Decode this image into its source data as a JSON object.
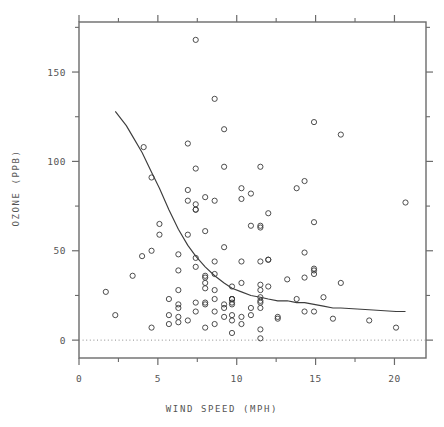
{
  "chart_data": {
    "type": "scatter",
    "title": "",
    "xlabel": "WIND SPEED (MPH)",
    "ylabel": "OZONE (PPB)",
    "xlim": [
      0,
      22
    ],
    "ylim": [
      -10,
      178
    ],
    "grid": false,
    "legend": "none",
    "x_ticks_major": [
      0,
      5,
      10,
      15,
      20
    ],
    "x_tick_labels": [
      "0",
      "5",
      "10",
      "15",
      "20"
    ],
    "x_ticks_minor": [
      2.5,
      7.5,
      12.5,
      17.5
    ],
    "y_ticks_major": [
      0,
      50,
      100,
      150
    ],
    "y_tick_labels": [
      "0",
      "50",
      "100",
      "150"
    ],
    "y_ticks_minor": [
      25,
      75,
      125,
      175
    ],
    "reference_line": {
      "orientation": "horizontal",
      "value": 0,
      "style": "dotted"
    },
    "marker": {
      "shape": "open-circle",
      "radius": 2.6,
      "color": "#3a3a3a"
    },
    "series": [
      {
        "name": "Ozone vs Wind",
        "points": [
          [
            7.4,
            41
          ],
          [
            8.0,
            36
          ],
          [
            12.6,
            12
          ],
          [
            11.5,
            18
          ],
          [
            8.6,
            28
          ],
          [
            13.8,
            23
          ],
          [
            20.1,
            7
          ],
          [
            8.6,
            16
          ],
          [
            6.9,
            11
          ],
          [
            9.7,
            14
          ],
          [
            9.2,
            18
          ],
          [
            10.9,
            14
          ],
          [
            13.2,
            34
          ],
          [
            11.5,
            6
          ],
          [
            12.0,
            30
          ],
          [
            18.4,
            11
          ],
          [
            11.5,
            1
          ],
          [
            9.7,
            11
          ],
          [
            9.7,
            4
          ],
          [
            16.6,
            32
          ],
          [
            9.7,
            23
          ],
          [
            12.0,
            45
          ],
          [
            16.6,
            115
          ],
          [
            14.9,
            37
          ],
          [
            8.0,
            29
          ],
          [
            12.0,
            71
          ],
          [
            14.9,
            39
          ],
          [
            5.7,
            23
          ],
          [
            7.4,
            21
          ],
          [
            8.6,
            37
          ],
          [
            9.7,
            20
          ],
          [
            16.1,
            12
          ],
          [
            9.2,
            13
          ],
          [
            8.6,
            135
          ],
          [
            14.3,
            49
          ],
          [
            8.0,
            32
          ],
          [
            11.5,
            64
          ],
          [
            14.9,
            40
          ],
          [
            20.7,
            77
          ],
          [
            9.2,
            97
          ],
          [
            11.5,
            97
          ],
          [
            10.3,
            85
          ],
          [
            6.3,
            10
          ],
          [
            1.7,
            27
          ],
          [
            4.6,
            7
          ],
          [
            6.3,
            48
          ],
          [
            8.0,
            35
          ],
          [
            8.0,
            61
          ],
          [
            10.3,
            79
          ],
          [
            11.5,
            63
          ],
          [
            14.9,
            16
          ],
          [
            8.0,
            80
          ],
          [
            4.1,
            108
          ],
          [
            9.2,
            20
          ],
          [
            9.2,
            52
          ],
          [
            10.9,
            82
          ],
          [
            4.6,
            50
          ],
          [
            10.9,
            64
          ],
          [
            5.1,
            59
          ],
          [
            6.3,
            39
          ],
          [
            5.7,
            9
          ],
          [
            7.4,
            16
          ],
          [
            8.6,
            78
          ],
          [
            14.3,
            35
          ],
          [
            14.9,
            66
          ],
          [
            14.9,
            122
          ],
          [
            14.3,
            89
          ],
          [
            6.9,
            110
          ],
          [
            10.3,
            44
          ],
          [
            6.3,
            28
          ],
          [
            5.1,
            65
          ],
          [
            11.5,
            22
          ],
          [
            6.9,
            59
          ],
          [
            9.7,
            23
          ],
          [
            11.5,
            31
          ],
          [
            8.6,
            44
          ],
          [
            8.0,
            21
          ],
          [
            8.6,
            9
          ],
          [
            12.0,
            45
          ],
          [
            7.4,
            168
          ],
          [
            7.4,
            73
          ],
          [
            7.4,
            76
          ],
          [
            9.2,
            118
          ],
          [
            6.9,
            84
          ],
          [
            13.8,
            85
          ],
          [
            7.4,
            96
          ],
          [
            6.9,
            78
          ],
          [
            7.4,
            73
          ],
          [
            4.6,
            91
          ],
          [
            4.0,
            47
          ],
          [
            10.3,
            32
          ],
          [
            8.0,
            20
          ],
          [
            8.6,
            23
          ],
          [
            11.5,
            21
          ],
          [
            11.5,
            24
          ],
          [
            11.5,
            44
          ],
          [
            9.7,
            21
          ],
          [
            11.5,
            28
          ],
          [
            10.3,
            9
          ],
          [
            6.3,
            13
          ],
          [
            7.4,
            46
          ],
          [
            10.9,
            18
          ],
          [
            10.3,
            13
          ],
          [
            15.5,
            24
          ],
          [
            14.3,
            16
          ],
          [
            12.6,
            13
          ],
          [
            9.7,
            23
          ],
          [
            3.4,
            36
          ],
          [
            8.0,
            7
          ],
          [
            5.7,
            14
          ],
          [
            9.7,
            30
          ],
          [
            2.3,
            14
          ],
          [
            6.3,
            18
          ],
          [
            6.3,
            20
          ]
        ]
      }
    ],
    "smoother": {
      "name": "lowess",
      "points": [
        [
          2.3,
          128
        ],
        [
          3.0,
          120
        ],
        [
          3.4,
          114
        ],
        [
          4.0,
          105
        ],
        [
          4.6,
          94
        ],
        [
          5.1,
          85
        ],
        [
          5.7,
          73
        ],
        [
          6.3,
          62
        ],
        [
          6.9,
          53
        ],
        [
          7.4,
          47
        ],
        [
          8.0,
          41
        ],
        [
          8.6,
          36
        ],
        [
          9.2,
          32
        ],
        [
          9.7,
          29
        ],
        [
          10.3,
          27
        ],
        [
          10.9,
          25
        ],
        [
          11.5,
          24
        ],
        [
          12.0,
          23
        ],
        [
          12.6,
          22
        ],
        [
          13.2,
          22
        ],
        [
          13.8,
          21
        ],
        [
          14.3,
          21
        ],
        [
          14.9,
          20
        ],
        [
          15.5,
          19
        ],
        [
          16.1,
          18
        ],
        [
          16.6,
          18
        ],
        [
          18.4,
          17
        ],
        [
          20.1,
          16
        ],
        [
          20.7,
          16
        ]
      ]
    }
  },
  "colors": {
    "axis": "#6b6b6b",
    "marker": "#3a3a3a",
    "smoother": "#3d3d3d",
    "reference": "#8c8c8c",
    "text": "#555555",
    "background": "#ffffff"
  }
}
